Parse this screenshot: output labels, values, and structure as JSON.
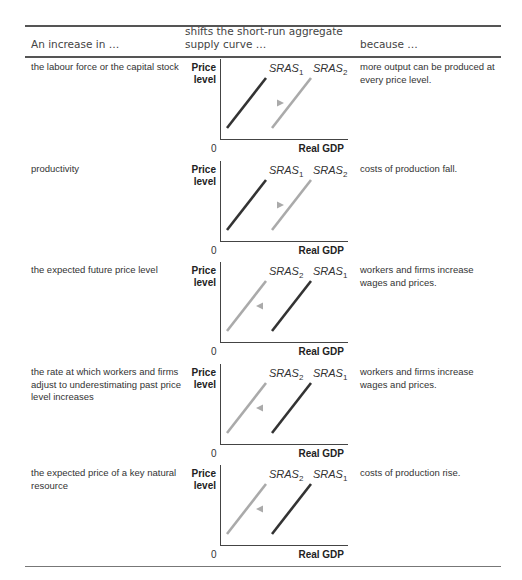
{
  "table": {
    "headers": {
      "col1": "An increase in …",
      "col2": "shifts the short-run aggregate supply curve …",
      "col3": "because …"
    },
    "rows": [
      {
        "cause": "the labour force or the capital stock",
        "direction": "right",
        "reason": "more output can be produced at every price level.",
        "left_label": "SRAS",
        "left_sub": "1",
        "right_label": "SRAS",
        "right_sub": "2"
      },
      {
        "cause": "productivity",
        "direction": "right",
        "reason": "costs of production fall.",
        "left_label": "SRAS",
        "left_sub": "1",
        "right_label": "SRAS",
        "right_sub": "2"
      },
      {
        "cause": "the expected future price level",
        "direction": "left",
        "reason": "workers and firms increase wages and prices.",
        "left_label": "SRAS",
        "left_sub": "2",
        "right_label": "SRAS",
        "right_sub": "1"
      },
      {
        "cause": "the rate at which workers and firms adjust to underestimating past price level increases",
        "direction": "left",
        "reason": "workers and firms increase wages and prices.",
        "left_label": "SRAS",
        "left_sub": "2",
        "right_label": "SRAS",
        "right_sub": "1"
      },
      {
        "cause": "the expected price of a key natural resource",
        "direction": "left",
        "reason": "costs of production rise.",
        "left_label": "SRAS",
        "left_sub": "2",
        "right_label": "SRAS",
        "right_sub": "1"
      }
    ]
  },
  "chart_axes": {
    "ylabel": "Price level",
    "ylabel_line1": "Price",
    "ylabel_line2": "level",
    "xlabel": "Real GDP",
    "origin": "0"
  },
  "colors": {
    "original_curve": "#333333",
    "shifted_curve": "#aaaaaa",
    "axis": "#444444"
  }
}
